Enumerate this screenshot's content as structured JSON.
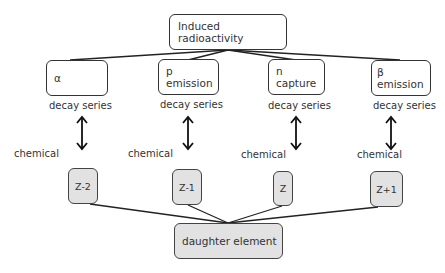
{
  "diagram": {
    "root": {
      "label": "Induced  radioactivity"
    },
    "processes": [
      {
        "label": "α",
        "sublabel": "decay series",
        "chemical_label": "chemical",
        "product": "Z-2"
      },
      {
        "label": "p emission",
        "sublabel": "decay series",
        "chemical_label": "chemical",
        "product": "Z-1"
      },
      {
        "label": "n capture",
        "sublabel": "decay series",
        "chemical_label": "chemical",
        "product": "Z"
      },
      {
        "label": "β emission",
        "sublabel": "decay series",
        "chemical_label": "chemical",
        "product": "Z+1"
      }
    ],
    "sink": {
      "label": "daughter element"
    },
    "colors": {
      "line": "#222222",
      "box_fill_top": "#ffffff",
      "box_fill_bottom": "#e2e2e2",
      "border": "#333333"
    }
  }
}
